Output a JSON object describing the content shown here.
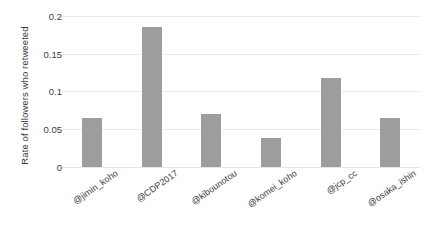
{
  "chart_data": {
    "type": "bar",
    "title": "",
    "xlabel": "",
    "ylabel": "Rate of followers who retweeted",
    "categories": [
      "@jimin_koho",
      "@CDP2017",
      "@kibounotou",
      "@komei_koho",
      "@jcp_cc",
      "@osaka_ishin"
    ],
    "values": [
      0.065,
      0.185,
      0.07,
      0.038,
      0.117,
      0.065
    ],
    "ylim": [
      0,
      0.2
    ],
    "yticks": [
      "0",
      "0.05",
      "0.1",
      "0.15",
      "0.2"
    ],
    "ytick_values": [
      0,
      0.05,
      0.1,
      0.15,
      0.2
    ],
    "grid": true,
    "legend": null,
    "bar_color": "#9d9d9d",
    "gridline_color": "#ececed",
    "background_color": "#ffffff",
    "text_color": "#3b3b3b"
  }
}
